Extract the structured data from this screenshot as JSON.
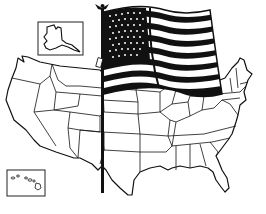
{
  "illustration": {
    "subject": "United States map with waving American flag",
    "style": "black and white line art",
    "colors": {
      "background": "#ffffff",
      "ink": "#111111"
    },
    "elements": {
      "map": "contiguous-us-state-outlines",
      "inset_alaska": "alaska-outline-in-box",
      "inset_hawaii": "hawaii-islands-in-box",
      "flag": "waving-us-flag-stars-and-stripes",
      "pole": "flagpole-with-eagle-finial"
    }
  }
}
